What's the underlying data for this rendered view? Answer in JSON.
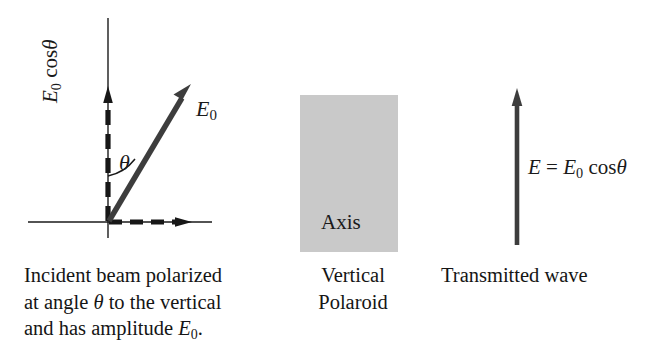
{
  "figure": {
    "background_color": "#ffffff",
    "ink_color": "#1a1a1a",
    "vector_color": "#3a3a3a",
    "polaroid_color": "#c9c9c9"
  },
  "left_panel": {
    "name": "incident-beam-diagram",
    "vector_label": "E",
    "vector_label_sub": "0",
    "component_label_prefix": "E",
    "component_label_sub": "0",
    "component_label_suffix": " cos",
    "component_label_theta": "θ",
    "angle_label": "θ",
    "axes": {
      "vertical_axis": "vertical-axis",
      "horizontal_axis": "horizontal-axis"
    },
    "caption_lines": [
      "Incident beam polarized",
      "at angle θ to the vertical",
      "and has amplitude E₀."
    ],
    "caption_line1": "Incident beam polarized",
    "caption_line2_a": "at angle ",
    "caption_line2_theta": "θ",
    "caption_line2_b": " to the vertical",
    "caption_line3_a": "and has amplitude ",
    "caption_line3_E": "E",
    "caption_line3_sub": "0",
    "caption_line3_end": "."
  },
  "middle_panel": {
    "name": "vertical-polaroid",
    "axis_label": "Axis",
    "caption_line1": "Vertical",
    "caption_line2": "Polaroid",
    "rect": {
      "x": 300,
      "y": 95,
      "width": 98,
      "height": 157
    }
  },
  "right_panel": {
    "name": "transmitted-wave",
    "equation_E": "E",
    "equation_eq": " = ",
    "equation_E0": "E",
    "equation_E0_sub": "0",
    "equation_cos": " cos",
    "equation_theta": "θ",
    "caption_line1": "Transmitted wave"
  },
  "icons": {
    "arrow_up_icon": "arrow-up-icon",
    "arrow_right_icon": "arrow-right-icon",
    "double_arrow_vertical_icon": "double-arrow-vertical-icon",
    "angle_arc_icon": "angle-arc-icon"
  }
}
